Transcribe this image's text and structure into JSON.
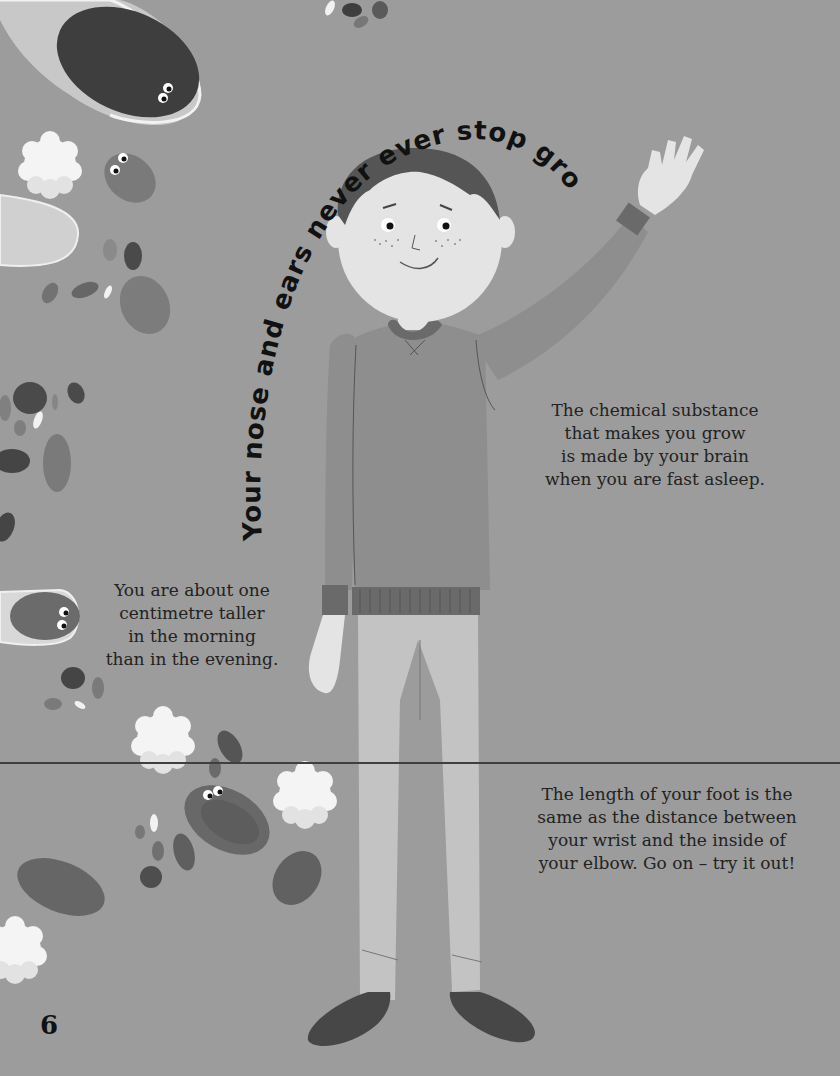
{
  "page": {
    "page_number": "6",
    "background_color": "#9c9c9c",
    "curved_headline": "Your nose and ears never ever stop growing.",
    "facts": [
      {
        "id": "growth-hormone",
        "text": "The chemical substance\nthat makes you grow\nis made by your brain\nwhen you are fast asleep."
      },
      {
        "id": "taller-morning",
        "text": "You are about one\ncentimetre taller\nin the morning\nthan in the evening."
      },
      {
        "id": "foot-length",
        "text": "The length of your foot is the\nsame as the distance between\nyour wrist and the inside of\nyour elbow. Go on – try it out!"
      }
    ]
  },
  "illustration": {
    "subject": "boy-waving",
    "decorations": "blood-cells-and-cartoon-cells"
  }
}
